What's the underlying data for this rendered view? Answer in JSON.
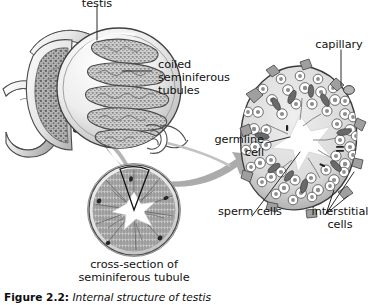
{
  "figure": {
    "caption_number": "Figure 2.2:",
    "caption_text": " Internal structure of testis"
  },
  "labels": {
    "testis": "testis",
    "coiled_seminiferous_tubules": "coiled\nseminiferous\ntubules",
    "cross_section": "cross-section of\nseminiferous tubule",
    "capillary": "capillary",
    "germline_cell": "germline\ncell",
    "sperm_cells": "sperm cells",
    "interstitial_cells": "interstitial\ncells"
  },
  "colors": {
    "ink": "#1a1a1a",
    "leader": "#2b2b2b",
    "arrow": "#a8a8a8",
    "tissue_dark": "#6e6e6e",
    "tissue_mid": "#9a9a9a",
    "tissue_light": "#d8d8d8",
    "outline": "#4a4a4a",
    "lumen": "#ffffff",
    "page": "#ffffff"
  }
}
